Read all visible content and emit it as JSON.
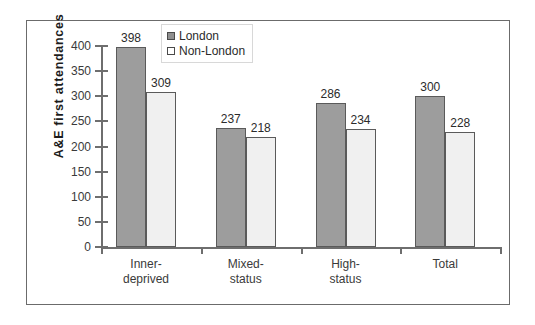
{
  "chart_data": {
    "type": "bar",
    "title": "",
    "subtitle": "",
    "xlabel": "",
    "ylabel": "A&E  first  attendances",
    "categories": [
      "Inner-\ndeprived",
      "Mixed-\nstatus",
      "High-\nstatus",
      "Total"
    ],
    "series": [
      {
        "name": "London",
        "values": [
          398,
          237,
          286,
          300
        ],
        "color": "#9d9d9d"
      },
      {
        "name": "Non-London",
        "values": [
          309,
          218,
          234,
          228
        ],
        "color": "#f0f0f0"
      }
    ],
    "ylim": [
      0,
      400
    ],
    "yticks": [
      0,
      50,
      100,
      150,
      200,
      250,
      300,
      350,
      400
    ],
    "ytick_labels": [
      "0",
      "50",
      "100",
      "150",
      "200",
      "250",
      "300",
      "350",
      "400"
    ],
    "grid": false,
    "legend_position": "top-center",
    "data_labels_shown": true
  },
  "legend": {
    "entries": [
      {
        "label": "London",
        "swatch": "dark-gray-square"
      },
      {
        "label": "Non-London",
        "swatch": "white-square"
      }
    ]
  },
  "axes": {
    "y_title": "A&E  first  attendances"
  }
}
